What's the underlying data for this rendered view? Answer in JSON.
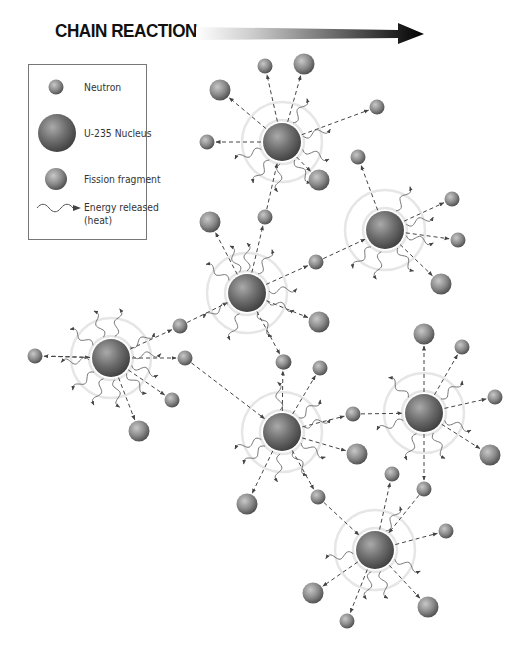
{
  "title": "CHAIN REACTION",
  "legend": {
    "items": [
      {
        "label": "Neutron",
        "icon": "neutron-icon"
      },
      {
        "label": "U-235 Nucleus",
        "icon": "nucleus-icon"
      },
      {
        "label": "Fission fragment",
        "icon": "fragment-icon"
      },
      {
        "label": "Energy released",
        "label2": "(heat)",
        "icon": "energy-wave-icon"
      }
    ]
  },
  "colors": {
    "ball_dark": "#555555",
    "ball_mid": "#8a8a8a",
    "ball_light": "#c8c8c8",
    "halo": "#e6e6e6",
    "arrow": "#444444"
  },
  "nuclei": [
    {
      "id": "A",
      "x": 111,
      "y": 358,
      "neutrons": [
        [
          35,
          356
        ],
        [
          180,
          326
        ],
        [
          185,
          358
        ],
        [
          172,
          400
        ]
      ],
      "fragments": [
        [
          139,
          431
        ]
      ],
      "incoming": [
        [
          44,
          356
        ]
      ],
      "waves": [
        215,
        250,
        280,
        330,
        355,
        20,
        45,
        80,
        110,
        140,
        175
      ]
    },
    {
      "id": "B",
      "x": 247,
      "y": 293,
      "neutrons": [
        [
          265,
          217
        ],
        [
          316,
          262
        ],
        [
          284,
          362
        ]
      ],
      "fragments": [
        [
          210,
          222
        ],
        [
          319,
          322
        ]
      ],
      "incoming": [
        [
          180,
          326
        ]
      ],
      "waves": [
        250,
        215,
        300,
        355,
        20,
        60,
        110,
        150,
        270
      ]
    },
    {
      "id": "C",
      "x": 282,
      "y": 142,
      "neutrons": [
        [
          265,
          66
        ],
        [
          207,
          142
        ],
        [
          377,
          107
        ]
      ],
      "fragments": [
        [
          304,
          64
        ],
        [
          220,
          90
        ],
        [
          319,
          180
        ]
      ],
      "incoming": [
        [
          265,
          217
        ]
      ],
      "waves": [
        300,
        345,
        20,
        55,
        95,
        125,
        160
      ]
    },
    {
      "id": "D",
      "x": 385,
      "y": 230,
      "neutrons": [
        [
          358,
          157
        ],
        [
          452,
          199
        ],
        [
          458,
          240
        ]
      ],
      "fragments": [
        [
          441,
          284
        ]
      ],
      "incoming": [
        [
          316,
          262
        ]
      ],
      "waves": [
        300,
        345,
        15,
        55,
        100,
        130
      ]
    },
    {
      "id": "E",
      "x": 282,
      "y": 432,
      "neutrons": [
        [
          283,
          362
        ],
        [
          320,
          368
        ],
        [
          353,
          414
        ],
        [
          318,
          497
        ]
      ],
      "fragments": [
        [
          247,
          504
        ],
        [
          357,
          454
        ]
      ],
      "incoming": [
        [
          185,
          358
        ]
      ],
      "waves": [
        265,
        320,
        345,
        30,
        60,
        95,
        140,
        160
      ]
    },
    {
      "id": "F",
      "x": 424,
      "y": 413,
      "neutrons": [
        [
          462,
          347
        ],
        [
          495,
          397
        ],
        [
          424,
          489
        ]
      ],
      "fragments": [
        [
          424,
          334
        ],
        [
          490,
          455
        ]
      ],
      "incoming": [
        [
          353,
          414
        ]
      ],
      "waves": [
        225,
        320,
        20,
        65,
        110,
        160
      ]
    },
    {
      "id": "G",
      "x": 375,
      "y": 550,
      "neutrons": [
        [
          392,
          474
        ],
        [
          446,
          531
        ],
        [
          347,
          621
        ]
      ],
      "fragments": [
        [
          313,
          593
        ],
        [
          428,
          607
        ]
      ],
      "incoming": [
        [
          318,
          497
        ],
        [
          424,
          489
        ]
      ],
      "waves": [
        300,
        25,
        75,
        100,
        170
      ]
    }
  ]
}
